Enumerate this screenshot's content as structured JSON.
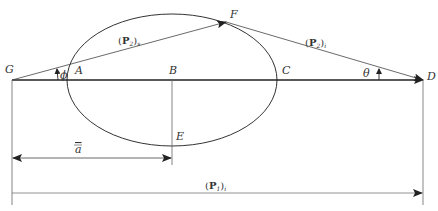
{
  "diagram": {
    "type": "geometric-construction",
    "points": {
      "G": {
        "label": "G",
        "x": 12,
        "y": 80
      },
      "A": {
        "label": "A",
        "x": 68,
        "y": 80
      },
      "B": {
        "label": "B",
        "x": 172,
        "y": 80
      },
      "C": {
        "label": "C",
        "x": 277,
        "y": 80
      },
      "D": {
        "label": "D",
        "x": 423,
        "y": 80
      },
      "E": {
        "label": "E",
        "x": 172,
        "y": 146
      },
      "F": {
        "label": "F",
        "x": 226,
        "y": 22
      }
    },
    "ellipse": {
      "cx": 172,
      "cy": 80,
      "rx": 105,
      "ry": 66
    },
    "angles": {
      "phi": {
        "label": "ϕ",
        "at": "G"
      },
      "theta": {
        "label": "θ",
        "at": "D"
      }
    },
    "vectors": {
      "GF": {
        "bold": "P",
        "sub_inner": "2",
        "sub_outer": "s"
      },
      "FD": {
        "bold": "P",
        "sub_inner": "2",
        "sub_outer": "i"
      },
      "GD_bottom": {
        "bold": "P",
        "sub_inner": "1",
        "sub_outer": "i"
      }
    },
    "dimension": {
      "label": "a",
      "overline": true,
      "from": "G",
      "to": "B"
    }
  },
  "colors": {
    "stroke": "#222222",
    "thin": "#555555",
    "text": "#333333"
  }
}
